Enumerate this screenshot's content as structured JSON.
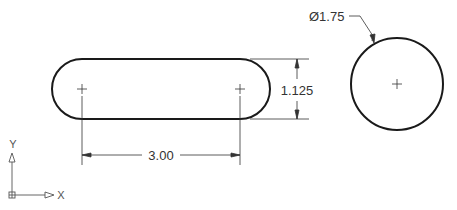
{
  "drawing": {
    "colors": {
      "background": "#ffffff",
      "object_line": "#1a1a1a",
      "dimension_line": "#333333",
      "ucs_icon": "#555555"
    },
    "slot": {
      "left_center": [
        82,
        89
      ],
      "right_center": [
        240,
        89
      ],
      "radius": 30
    },
    "circle": {
      "center": [
        397,
        84
      ],
      "radius": 46
    },
    "dimensions": {
      "horizontal": {
        "label": "3.00"
      },
      "vertical": {
        "label": "1.125"
      },
      "diameter": {
        "label": "Ø1.75"
      }
    },
    "ucs_icon": {
      "y_label": "Y",
      "x_label": "X"
    }
  }
}
